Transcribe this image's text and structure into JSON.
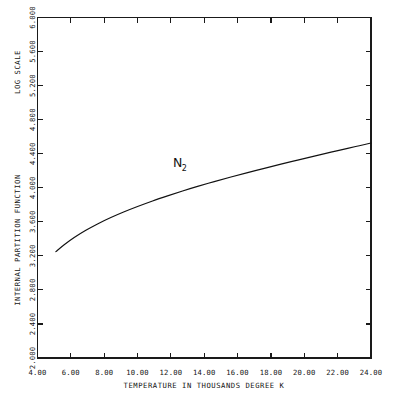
{
  "chart_data": {
    "type": "line",
    "title": "",
    "subtitle": "",
    "xlabel": "TEMPERATURE IN THOUSANDS DEGREE K",
    "ylabel": "INTERNAL PARTITION FUNCTION",
    "ylabel_secondary": "LOG SCALE",
    "xlim": [
      4.0,
      24.0
    ],
    "ylim": [
      2.0,
      6.0
    ],
    "grid": false,
    "legend_position": "inline-annotation",
    "xticks": [
      4.0,
      6.0,
      8.0,
      10.0,
      12.0,
      14.0,
      16.0,
      18.0,
      20.0,
      22.0,
      24.0
    ],
    "xtick_labels": [
      "4.00",
      "6.00",
      "8.00",
      "10.00",
      "12.00",
      "14.00",
      "16.00",
      "18.00",
      "20.00",
      "22.00",
      "24.00"
    ],
    "yticks": [
      2.0,
      2.4,
      2.8,
      3.2,
      3.6,
      4.0,
      4.4,
      4.8,
      5.2,
      5.6,
      6.0
    ],
    "ytick_labels": [
      "2.000",
      "2.400",
      "2.800",
      "3.200",
      "3.600",
      "4.000",
      "4.400",
      "4.800",
      "5.200",
      "5.600",
      "6.000"
    ],
    "annotations": [
      {
        "text": "N",
        "subscript": "2",
        "x": 12.4,
        "y": 4.24
      }
    ],
    "series": [
      {
        "name": "N2",
        "color": "#111111",
        "x": [
          5.1,
          5.6,
          6.2,
          6.9,
          7.6,
          8.4,
          9.2,
          10.0,
          10.9,
          11.8,
          12.7,
          13.6,
          14.6,
          15.6,
          16.6,
          17.6,
          18.6,
          19.6,
          20.6,
          21.6,
          22.6,
          23.3,
          24.0
        ],
        "y": [
          3.25,
          3.33,
          3.415,
          3.5,
          3.575,
          3.65,
          3.718,
          3.78,
          3.845,
          3.905,
          3.962,
          4.016,
          4.072,
          4.126,
          4.178,
          4.228,
          4.277,
          4.325,
          4.372,
          4.418,
          4.463,
          4.494,
          4.525
        ]
      }
    ]
  },
  "figure": {
    "background_color": "#ffffff",
    "line_color": "#1a1a1a",
    "frame_color": "#1a1a1a"
  }
}
